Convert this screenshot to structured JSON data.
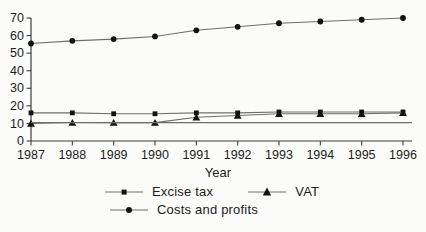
{
  "figure": {
    "xlabel": "Year"
  },
  "colors": {
    "background": "#fbfbfa",
    "axis": "#3d3d3d",
    "series_line": "#6e6e6e",
    "marker": "#121212",
    "text": "#1c1c1c"
  },
  "chart_data": {
    "type": "line",
    "x": [
      1987,
      1988,
      1989,
      1990,
      1991,
      1992,
      1993,
      1994,
      1995,
      1996
    ],
    "xlabel": "Year",
    "ylabel": "",
    "ylim": [
      0,
      70
    ],
    "yticks": [
      0,
      10,
      20,
      30,
      40,
      50,
      60,
      70
    ],
    "grid": false,
    "legend_position": "bottom",
    "series": [
      {
        "name": "Excise tax",
        "marker": "square",
        "values": [
          16,
          16,
          15.5,
          15.5,
          16,
          16,
          16.5,
          16.5,
          16.5,
          16.5
        ]
      },
      {
        "name": "VAT",
        "marker": "triangle",
        "values": [
          10,
          10.5,
          10.5,
          10.5,
          13.5,
          14.5,
          15.5,
          15.5,
          15.5,
          16
        ]
      },
      {
        "name": "Costs and profits",
        "marker": "circle",
        "values": [
          55.5,
          57,
          58,
          59.5,
          63,
          65,
          67,
          68,
          69,
          70
        ]
      },
      {
        "name": "",
        "marker": "none",
        "values": [
          10.5,
          10.5,
          10.5,
          10.5,
          10.5,
          10.5,
          10.5,
          10.5,
          10.5,
          10.5
        ]
      }
    ]
  },
  "legend": {
    "items": [
      {
        "label": "Excise tax",
        "marker": "square"
      },
      {
        "label": "VAT",
        "marker": "triangle"
      },
      {
        "label": "Costs and profits",
        "marker": "circle"
      }
    ]
  }
}
